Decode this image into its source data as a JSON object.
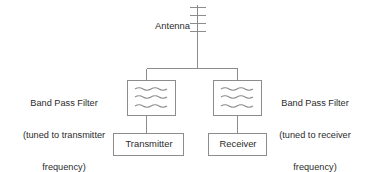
{
  "diagram": {
    "background_color": "#ffffff",
    "line_color": "#8c8c8c",
    "text_color": "#2b2b2b",
    "nodes": {
      "antenna": {
        "label": "Antenna",
        "icon": "antenna-icon",
        "crossbar_count": 4
      },
      "bpf_transmitter": {
        "label": "Band Pass Filter\n(tuned to transmitter\nfrequency)",
        "label_line1": "Band Pass Filter",
        "label_line2": "(tuned to transmitter",
        "label_line3": "frequency)",
        "icon": "wavy-lines-icon",
        "wave_count": 3
      },
      "bpf_receiver": {
        "label": "Band Pass Filter\n(tuned to receiver\nfrequency)",
        "label_line1": "Band Pass Filter",
        "label_line2": "(tuned to receiver",
        "label_line3": "frequency)",
        "icon": "wavy-lines-icon",
        "wave_count": 3
      },
      "transmitter": {
        "label": "Transmitter"
      },
      "receiver": {
        "label": "Receiver"
      }
    },
    "connections": [
      {
        "from": "antenna",
        "to": "junction"
      },
      {
        "from": "junction",
        "to": "bpf_transmitter"
      },
      {
        "from": "junction",
        "to": "bpf_receiver"
      },
      {
        "from": "bpf_transmitter",
        "to": "transmitter"
      },
      {
        "from": "bpf_receiver",
        "to": "receiver"
      }
    ]
  }
}
